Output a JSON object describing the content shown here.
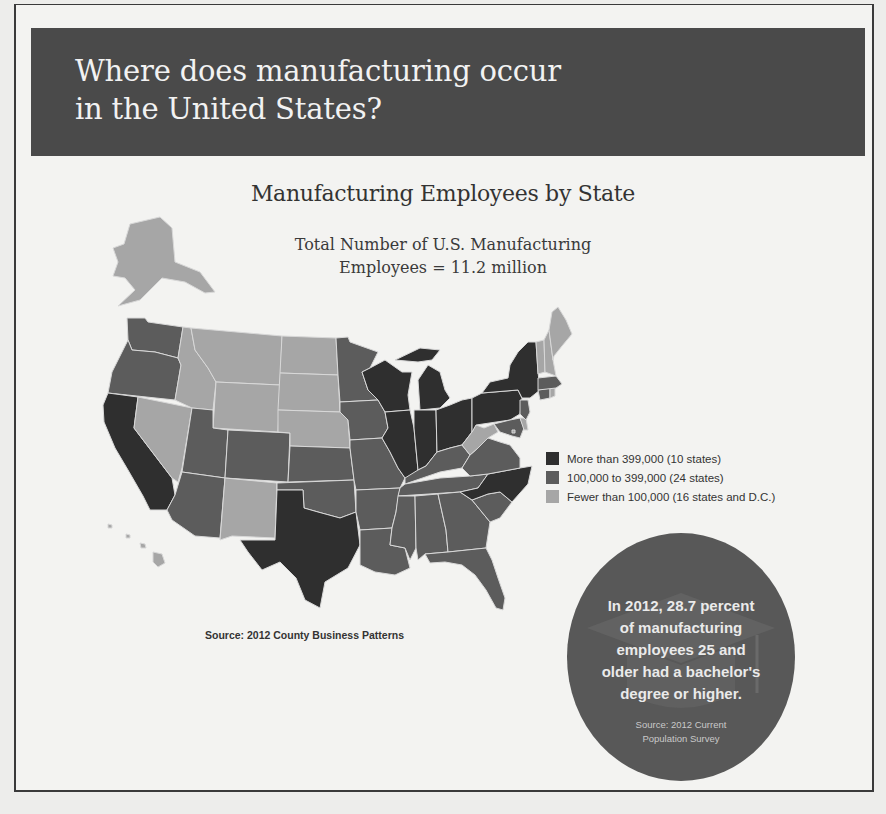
{
  "header": {
    "title": "Where does manufacturing occur\nin the United States?"
  },
  "map": {
    "title": "Manufacturing Employees by State",
    "subtitle": "Total Number of U.S. Manufacturing\nEmployees = 11.2 million",
    "source": "Source: 2012 County Business Patterns",
    "colors": {
      "high": "#2f2f2f",
      "medium": "#5c5c5c",
      "low": "#a6a6a6"
    },
    "legend": [
      {
        "key": "high",
        "label": "More than 399,000 (10 states)"
      },
      {
        "key": "medium",
        "label": "100,000 to 399,000 (24 states)"
      },
      {
        "key": "low",
        "label": "Fewer than 100,000 (16 states and D.C.)"
      }
    ],
    "states": {
      "CA": "high",
      "TX": "high",
      "IL": "high",
      "IN": "high",
      "WI": "high",
      "MI": "high",
      "OH": "high",
      "PA": "high",
      "NY": "high",
      "NC": "high",
      "WA": "medium",
      "OR": "medium",
      "UT": "medium",
      "CO": "medium",
      "AZ": "medium",
      "MN": "medium",
      "IA": "medium",
      "KS": "medium",
      "OK": "medium",
      "MO": "medium",
      "AR": "medium",
      "LA": "medium",
      "MS": "medium",
      "AL": "medium",
      "TN": "medium",
      "KY": "medium",
      "GA": "medium",
      "SC": "medium",
      "FL": "medium",
      "VA": "medium",
      "MA": "medium",
      "CT": "medium",
      "NJ": "medium",
      "MD": "medium",
      "AK": "low",
      "HI": "low",
      "NV": "low",
      "ID": "low",
      "MT": "low",
      "WY": "low",
      "NM": "low",
      "ND": "low",
      "SD": "low",
      "NE": "low",
      "WV": "low",
      "ME": "low",
      "NH": "low",
      "VT": "low",
      "RI": "low",
      "DE": "low",
      "DC": "low"
    }
  },
  "callout": {
    "text": "In 2012, 28.7 percent\nof manufacturing\nemployees 25 and\nolder had a bachelor's\ndegree or higher.",
    "source": "Source:  2012 Current\nPopulation Survey"
  }
}
